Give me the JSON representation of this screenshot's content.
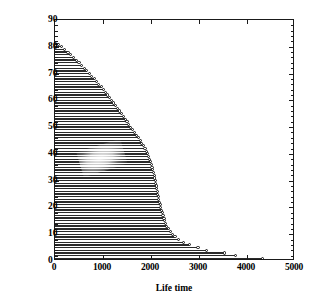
{
  "chart_data": {
    "type": "bar",
    "orientation": "horizontal",
    "title": "",
    "xlabel": "Life time",
    "ylabel": "Unit number",
    "xlim": [
      0,
      5000
    ],
    "ylim": [
      0,
      90
    ],
    "xticks": [
      0,
      1000,
      2000,
      3000,
      4000,
      5000
    ],
    "yticks": [
      0,
      10,
      20,
      30,
      40,
      50,
      60,
      70,
      80,
      90
    ],
    "xtick_labels": [
      "0",
      "1000",
      "2000",
      "3000",
      "4000",
      "5000"
    ],
    "ytick_labels": [
      "0",
      "10",
      "20",
      "30",
      "40",
      "50",
      "60",
      "70",
      "80",
      "90"
    ],
    "grid": false,
    "legend": null,
    "marker": "open-circle-at-bar-end",
    "categories": [
      1,
      2,
      3,
      4,
      5,
      6,
      7,
      8,
      9,
      10,
      11,
      12,
      13,
      14,
      15,
      16,
      17,
      18,
      19,
      20,
      21,
      22,
      23,
      24,
      25,
      26,
      27,
      28,
      29,
      30,
      31,
      32,
      33,
      34,
      35,
      36,
      37,
      38,
      39,
      40,
      41,
      42,
      43,
      44,
      45,
      46,
      47,
      48,
      49,
      50,
      51,
      52,
      53,
      54,
      55,
      56,
      57,
      58,
      59,
      60,
      61,
      62,
      63,
      64,
      65,
      66,
      67,
      68,
      69,
      70,
      71,
      72,
      73,
      74,
      75,
      76,
      77,
      78,
      79,
      80,
      81
    ],
    "values": [
      4330,
      3760,
      3540,
      3160,
      2980,
      2800,
      2680,
      2580,
      2500,
      2440,
      2400,
      2360,
      2330,
      2310,
      2290,
      2270,
      2250,
      2235,
      2220,
      2205,
      2190,
      2175,
      2160,
      2150,
      2140,
      2130,
      2120,
      2110,
      2100,
      2090,
      2080,
      2065,
      2050,
      2035,
      2020,
      2005,
      1990,
      1970,
      1950,
      1930,
      1905,
      1875,
      1840,
      1810,
      1780,
      1740,
      1700,
      1660,
      1620,
      1580,
      1540,
      1500,
      1460,
      1420,
      1380,
      1340,
      1300,
      1260,
      1220,
      1180,
      1140,
      1095,
      1050,
      1005,
      960,
      915,
      865,
      815,
      765,
      715,
      665,
      610,
      555,
      500,
      445,
      390,
      330,
      270,
      205,
      140,
      75
    ]
  },
  "axis": {
    "x_title": "Life time",
    "y_title": "Unit number"
  }
}
